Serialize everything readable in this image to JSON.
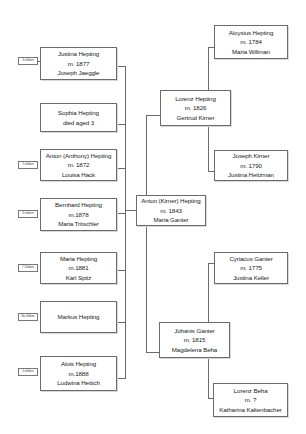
{
  "diagram": {
    "type": "family-tree",
    "children": [
      {
        "name": "Justina Hepting",
        "line2": "m. 1877",
        "line3": "Joseph Jaeggle",
        "children_label": "3 children"
      },
      {
        "name": "Sophia Hepting",
        "line2": "died aged 3",
        "line3": "",
        "children_label": ""
      },
      {
        "name": "Anton (Anthony) Hepting",
        "line2": "m. 1872",
        "line3": "Louisa Hack",
        "children_label": "5 children"
      },
      {
        "name": "Bernhard Hepting",
        "line2": "m.1878",
        "line3": "Maria Tritschler",
        "children_label": "6 children"
      },
      {
        "name": "Maria Hepting",
        "line2": "m.1881",
        "line3": "Karl Spitz",
        "children_label": "7 Children"
      },
      {
        "name": "Markus Hepting",
        "line2": "",
        "line3": "",
        "children_label": "No children"
      },
      {
        "name": "Alois Hepting",
        "line2": "m.1888",
        "line3": "Ludwina Hettich",
        "children_label": "4 children"
      }
    ],
    "root": {
      "name": "Anton (Kirner) Hepting",
      "line2": "m. 1843",
      "line3": "Maria Ganter"
    },
    "parents": [
      {
        "name": "Lorenz Hepting",
        "line2": "m. 1826",
        "line3": "Gertrud Kirner"
      },
      {
        "name": "Johanis Ganter",
        "line2": "m. 1815",
        "line3": "Magdelena Beha"
      }
    ],
    "grandparents": [
      {
        "name": "Aloysius Hepting",
        "line2": "m. 1784",
        "line3": "Maria Willman"
      },
      {
        "name": "Joseph Kirner",
        "line2": "m. 1790",
        "line3": "Justina Heitzman"
      },
      {
        "name": "Cyriacus Ganter",
        "line2": "m. 1775",
        "line3": "Justina Keller"
      },
      {
        "name": "Lorenz Beha",
        "line2": "m. ?",
        "line3": "Katharina Kaltenbacher"
      }
    ],
    "colors": {
      "border": "#6b6b6b",
      "text": "#222222",
      "background": "#ffffff"
    }
  }
}
